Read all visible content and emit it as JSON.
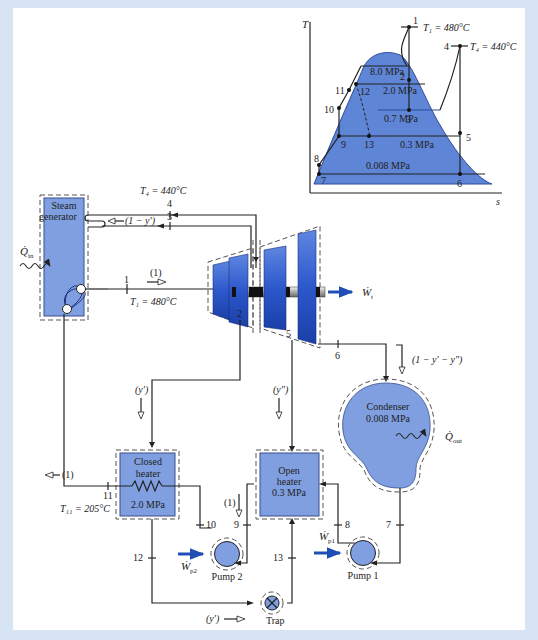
{
  "ts_diagram": {
    "axis_y": "T",
    "axis_x": "s",
    "state_labels": [
      "1",
      "2",
      "3",
      "4",
      "5",
      "6",
      "7",
      "8",
      "9",
      "10",
      "11",
      "12",
      "13"
    ],
    "t1": "T₁ = 480°C",
    "t4": "T₄ = 440°C",
    "pressures": [
      "8.0 MPa",
      "2.0 MPa",
      "0.7 MPa",
      "0.3 MPa",
      "0.008 MPa"
    ]
  },
  "components": {
    "steam_generator": {
      "line1": "Steam",
      "line2": "generator"
    },
    "qin": "Q̇",
    "qin_sub": "in",
    "turbine_work": "Ẇ",
    "turbine_work_sub": "t",
    "condenser": {
      "line1": "Condenser",
      "line2": "0.008 MPa"
    },
    "qout": "Q̇",
    "qout_sub": "out",
    "closed_heater": {
      "line1": "Closed",
      "line2": "heater",
      "line3": "2.0 MPa"
    },
    "open_heater": {
      "line1": "Open",
      "line2": "heater",
      "line3": "0.3 MPa"
    },
    "pump1": "Pump 1",
    "pump2": "Pump 2",
    "wp1": "Ẇ",
    "wp1_sub": "p1",
    "wp2": "Ẇ",
    "wp2_sub": "p2",
    "trap": "Trap"
  },
  "annotations": {
    "t4": "T₄ = 440°C",
    "t1": "T₁ = 480°C",
    "t11": "T₁₁ = 205°C",
    "frac_reheat": "(1 − y′)",
    "frac_one_main": "(1)",
    "frac_one_closed": "(1)",
    "frac_one_pump2": "(1)",
    "frac_y1": "(y′)",
    "frac_y2": "(y″)",
    "frac_cond": "(1 − y′ − y″)",
    "frac_trap": "(y′)"
  },
  "state_points": {
    "p1": "1",
    "p2": "2",
    "p3": "3",
    "p4": "4",
    "p5": "5",
    "p6": "6",
    "p7": "7",
    "p8": "8",
    "p9": "9",
    "p10": "10",
    "p11": "11",
    "p12": "12",
    "p13": "13"
  },
  "colors": {
    "frame": "#d6e4f4",
    "component_fill": "#7f9fe0",
    "turbine_blue": "#2a55c8",
    "work_arrow": "#1f4fb5"
  }
}
